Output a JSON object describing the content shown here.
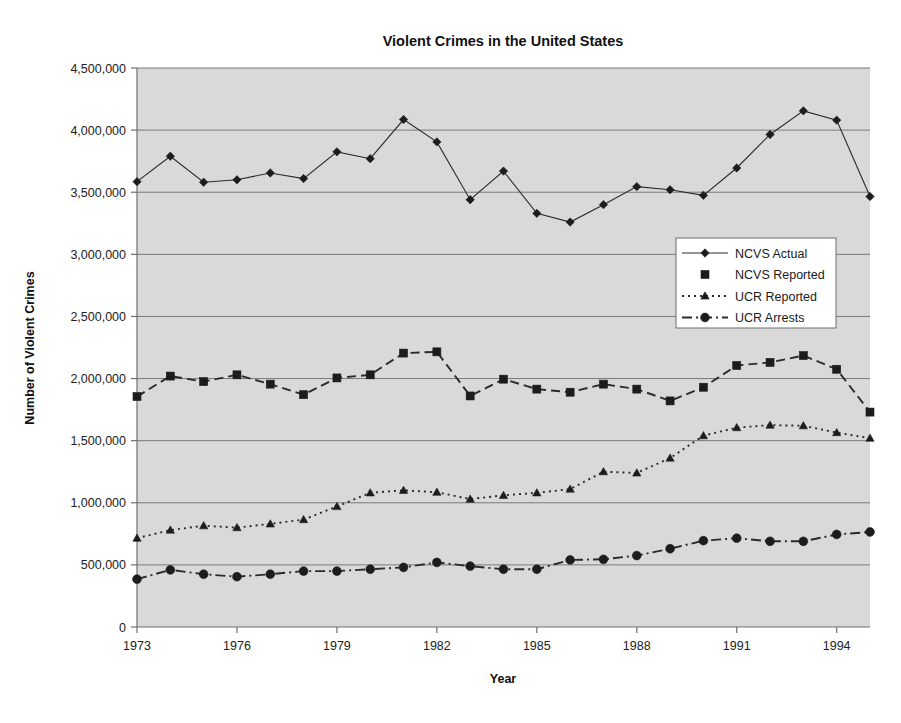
{
  "chart_data": {
    "type": "line",
    "title": "Violent Crimes in the United States",
    "xlabel": "Year",
    "ylabel": "Number of Violent Crimes",
    "grid": true,
    "legend_position": "center-right",
    "xlim": [
      1973,
      1995
    ],
    "ylim": [
      0,
      4500000
    ],
    "ytick_step": 500000,
    "x": [
      1973,
      1974,
      1975,
      1976,
      1977,
      1978,
      1979,
      1980,
      1981,
      1982,
      1983,
      1984,
      1985,
      1986,
      1987,
      1988,
      1989,
      1990,
      1991,
      1992,
      1993,
      1994,
      1995
    ],
    "xtick_labels": [
      "1973",
      "1976",
      "1979",
      "1982",
      "1985",
      "1988",
      "1991",
      "1994"
    ],
    "xtick_values": [
      1973,
      1976,
      1979,
      1982,
      1985,
      1988,
      1991,
      1994
    ],
    "ytick_labels": [
      "0",
      "500,000",
      "1,000,000",
      "1,500,000",
      "2,000,000",
      "2,500,000",
      "3,000,000",
      "3,500,000",
      "4,000,000",
      "4,500,000"
    ],
    "ytick_values": [
      0,
      500000,
      1000000,
      1500000,
      2000000,
      2500000,
      3000000,
      3500000,
      4000000,
      4500000
    ],
    "series": [
      {
        "name": "NCVS Actual",
        "marker": "diamond",
        "dash": "solid",
        "values": [
          3585000,
          3790000,
          3580000,
          3600000,
          3655000,
          3610000,
          3825000,
          3770000,
          4085000,
          3905000,
          3440000,
          3670000,
          3330000,
          3260000,
          3400000,
          3545000,
          3520000,
          3475000,
          3695000,
          3965000,
          4155000,
          4080000,
          3465000
        ]
      },
      {
        "name": "NCVS Reported",
        "marker": "square",
        "dash": "dashed",
        "values": [
          1855000,
          2020000,
          1975000,
          2030000,
          1955000,
          1870000,
          2005000,
          2030000,
          2205000,
          2215000,
          1860000,
          1995000,
          1915000,
          1890000,
          1955000,
          1915000,
          1820000,
          1930000,
          2105000,
          2130000,
          2185000,
          2075000,
          1730000
        ]
      },
      {
        "name": "UCR Reported",
        "marker": "triangle",
        "dash": "dotted",
        "values": [
          715000,
          780000,
          815000,
          800000,
          830000,
          865000,
          970000,
          1080000,
          1100000,
          1085000,
          1030000,
          1060000,
          1080000,
          1110000,
          1250000,
          1240000,
          1360000,
          1540000,
          1605000,
          1625000,
          1620000,
          1565000,
          1520000
        ]
      },
      {
        "name": "UCR Arrests",
        "marker": "circle",
        "dash": "dashdot",
        "values": [
          385000,
          460000,
          425000,
          405000,
          425000,
          450000,
          450000,
          465000,
          480000,
          520000,
          490000,
          465000,
          465000,
          540000,
          545000,
          575000,
          630000,
          695000,
          715000,
          690000,
          690000,
          745000,
          765000
        ]
      }
    ]
  },
  "colors": {
    "plot_background": "#d9d9d9",
    "page_background": "#ffffff",
    "gridline": "#7a7a7a",
    "series_ink": "#1c1c1c",
    "axis": "#6e6e6e"
  },
  "caption": {
    "text": ""
  }
}
